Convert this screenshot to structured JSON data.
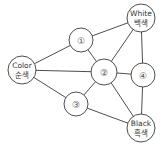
{
  "diagram": {
    "type": "graph",
    "nodes": [
      {
        "id": "white",
        "line1": "White",
        "line2": "백색",
        "x": 141,
        "y": 18,
        "r": 14
      },
      {
        "id": "n1",
        "label": "①",
        "x": 81,
        "y": 40,
        "r": 12
      },
      {
        "id": "color",
        "line1": "Color",
        "line2": "순색",
        "x": 22,
        "y": 70,
        "r": 14
      },
      {
        "id": "n2",
        "label": "②",
        "x": 104,
        "y": 72,
        "r": 13
      },
      {
        "id": "n4",
        "label": "④",
        "x": 143,
        "y": 75,
        "r": 12
      },
      {
        "id": "n3",
        "label": "③",
        "x": 76,
        "y": 104,
        "r": 12
      },
      {
        "id": "black",
        "line1": "Black",
        "line2": "흑색",
        "x": 141,
        "y": 128,
        "r": 14
      }
    ],
    "edges": [
      [
        "color",
        "n1"
      ],
      [
        "color",
        "n2"
      ],
      [
        "color",
        "n3"
      ],
      [
        "n1",
        "white"
      ],
      [
        "n1",
        "n2"
      ],
      [
        "n2",
        "white"
      ],
      [
        "n2",
        "n4"
      ],
      [
        "n2",
        "n3"
      ],
      [
        "n2",
        "black"
      ],
      [
        "white",
        "n4"
      ],
      [
        "n4",
        "black"
      ],
      [
        "n3",
        "black"
      ]
    ],
    "colors": {
      "stroke": "#3a3a3a",
      "fill": "#ffffff",
      "text": "#333333"
    }
  }
}
